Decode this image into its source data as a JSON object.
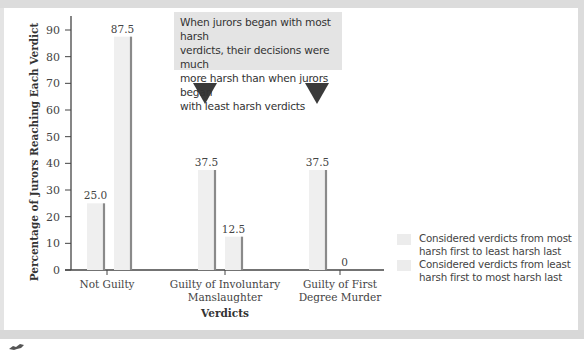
{
  "chart_data": {
    "type": "bar",
    "title": "",
    "xlabel": "Verdicts",
    "ylabel": "Percentage of Jurors Reaching Each Verdict",
    "ylim": [
      0,
      95
    ],
    "yticks": [
      0,
      10,
      20,
      30,
      40,
      50,
      60,
      70,
      80,
      90
    ],
    "grid": false,
    "legend_position": "right-bottom",
    "categories": [
      "Not Guilty",
      "Guilty of Involuntary Manslaughter",
      "Guilty of First Degree Murder"
    ],
    "category_lines": [
      [
        "Not Guilty"
      ],
      [
        "Guilty of  Involuntary",
        "Manslaughter"
      ],
      [
        "Guilty of First",
        "Degree Murder"
      ]
    ],
    "series": [
      {
        "name": "Considered verdicts from least harsh first to most harsh last",
        "values": [
          25.0,
          37.5,
          37.5
        ],
        "labels": [
          "25.0",
          "37.5",
          "37.5"
        ],
        "color": "#efefef"
      },
      {
        "name": "Considered verdicts from most harsh first to least harsh last",
        "values": [
          87.5,
          12.5,
          0
        ],
        "labels": [
          "87.5",
          "12.5",
          "0"
        ],
        "color": "#efefef"
      }
    ],
    "annotations": [
      {
        "text": "When jurors began with most harsh verdicts, their decisions were much more harsh than when jurors began with least harsh verdicts",
        "arrows_point_to": [
          "Guilty of Involuntary Manslaughter",
          "Guilty of First Degree Murder"
        ]
      }
    ]
  },
  "callout": {
    "lines": [
      "When jurors began with most harsh",
      "verdicts, their decisions were much",
      "more harsh than when jurors began",
      "with least harsh verdicts"
    ],
    "arrow_color": "#3a3a3a"
  },
  "legend": {
    "items": [
      {
        "label_lines": [
          "Considered verdicts from most",
          "harsh first to least harsh last"
        ]
      },
      {
        "label_lines": [
          "Considered verdicts from least",
          "harsh first to most harsh last"
        ]
      }
    ]
  },
  "colors": {
    "bar_fill": "#efefef",
    "bar_edge": "#8a8a8a",
    "axis": "#444444",
    "frame": "#dcdcdc"
  }
}
